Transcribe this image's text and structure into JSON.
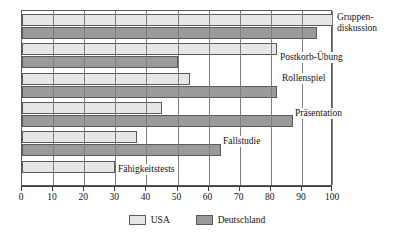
{
  "chart_data": {
    "type": "bar",
    "orientation": "horizontal",
    "title": "",
    "xlabel": "",
    "ylabel": "",
    "xlim": [
      0,
      100
    ],
    "xticks": [
      0,
      10,
      20,
      30,
      40,
      50,
      60,
      70,
      80,
      90,
      100
    ],
    "xtick_labels": [
      "0",
      "10",
      "20",
      "30",
      "40",
      "50",
      "60",
      "70",
      "80",
      "90",
      "100"
    ],
    "grid": true,
    "grid_axis": "x",
    "legend_position": "bottom-center",
    "categories": [
      "Gruppendiskussion",
      "Postkorb-Übung",
      "Rollenspiel",
      "Präsentation",
      "Fallstudie",
      "Fähigkeitstests"
    ],
    "category_labels_display": [
      "Gruppen-\ndiskussion",
      "Postkorb-Übung",
      "Rollenspiel",
      "Präsentation",
      "Fallstudie",
      "Fähigkeitstests"
    ],
    "series": [
      {
        "name": "USA",
        "color": "#e6e6e6",
        "values": [
          100,
          82,
          54,
          45,
          37,
          30
        ]
      },
      {
        "name": "Deutschland",
        "color": "#9a9a9a",
        "values": [
          95,
          50,
          82,
          87,
          64,
          0
        ]
      }
    ]
  },
  "legend": {
    "entries": [
      {
        "label": "USA",
        "color": "#e6e6e6"
      },
      {
        "label": "Deutschland",
        "color": "#9a9a9a"
      }
    ]
  },
  "axis": {
    "tick_labels": [
      "0",
      "10",
      "20",
      "30",
      "40",
      "50",
      "60",
      "70",
      "80",
      "90",
      "100"
    ]
  },
  "labels": {
    "gruppendiskussion_line1": "Gruppen-",
    "gruppendiskussion_line2": "diskussion",
    "postkorb": "Postkorb-Übung",
    "rollenspiel": "Rollenspiel",
    "praesentation": "Präsentation",
    "fallstudie": "Fallstudie",
    "faehigkeitstests": "Fähigkeitstests"
  }
}
